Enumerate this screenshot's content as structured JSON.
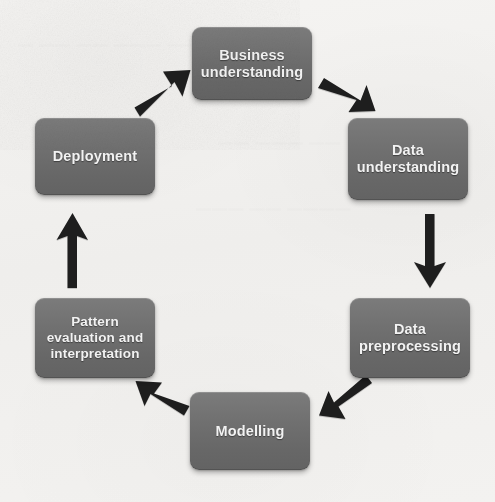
{
  "diagram": {
    "type": "cycle",
    "background_color": "#f2f1ef",
    "node_color": "#6f6f6f",
    "node_text_color": "#f2f2f2",
    "arrow_color": "#1e1e1e",
    "nodes": [
      {
        "id": "business-understanding",
        "label": "Business\nunderstanding",
        "position": "top"
      },
      {
        "id": "data-understanding",
        "label": "Data\nunderstanding",
        "position": "top-right"
      },
      {
        "id": "data-preprocessing",
        "label": "Data\npreprocessing",
        "position": "bottom-right"
      },
      {
        "id": "modelling",
        "label": "Modelling",
        "position": "bottom"
      },
      {
        "id": "pattern-evaluation",
        "label": "Pattern\nevaluation and\ninterpretation",
        "position": "bottom-left"
      },
      {
        "id": "deployment",
        "label": "Deployment",
        "position": "top-left"
      }
    ],
    "edges": [
      {
        "id": "business-to-data-understanding",
        "from": "business-understanding",
        "to": "data-understanding",
        "direction": "down-right"
      },
      {
        "id": "data-understanding-to-preprocessing",
        "from": "data-understanding",
        "to": "data-preprocessing",
        "direction": "down"
      },
      {
        "id": "preprocessing-to-modelling",
        "from": "data-preprocessing",
        "to": "modelling",
        "direction": "down-left"
      },
      {
        "id": "modelling-to-pattern-evaluation",
        "from": "modelling",
        "to": "pattern-evaluation",
        "direction": "up-left"
      },
      {
        "id": "pattern-evaluation-to-deployment",
        "from": "pattern-evaluation",
        "to": "deployment",
        "direction": "up"
      },
      {
        "id": "deployment-to-business",
        "from": "deployment",
        "to": "business-understanding",
        "direction": "up-right"
      }
    ],
    "bleed_text": [
      {
        "id": "bleed-top",
        "text": "— —— —— ——— ——",
        "x": 18,
        "y": 36
      },
      {
        "id": "bleed-mid",
        "text": "—— ——— ——",
        "x": 218,
        "y": 134
      },
      {
        "id": "bleed-low",
        "text": "——— —— ————",
        "x": 196,
        "y": 200
      }
    ]
  }
}
